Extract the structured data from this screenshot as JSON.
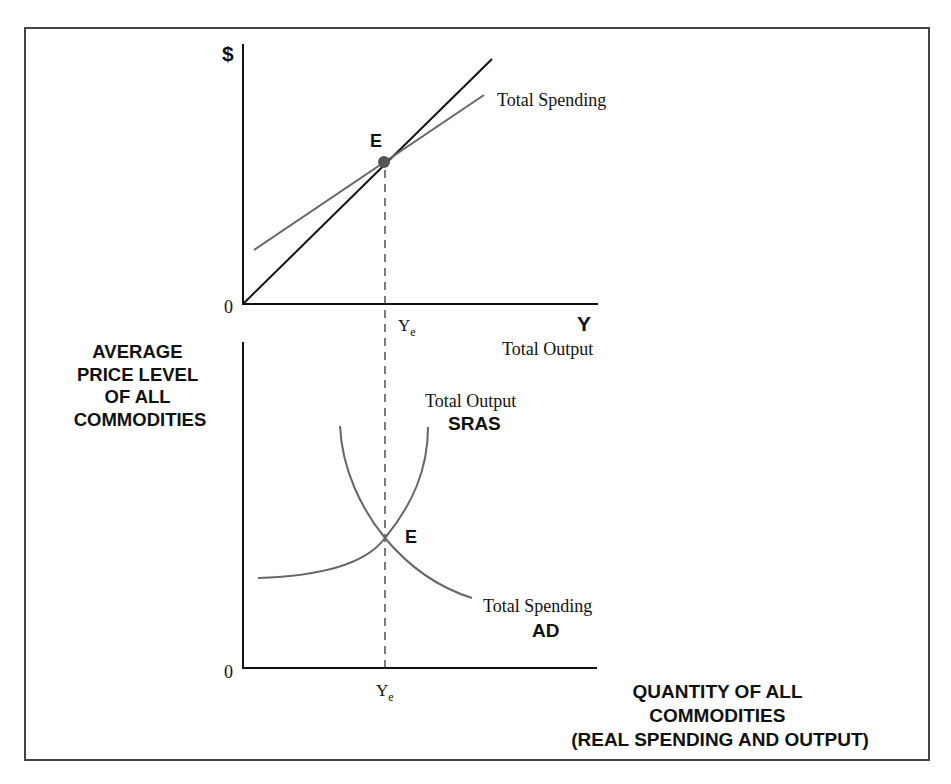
{
  "top_panel": {
    "y_axis_label": "$",
    "origin_label": "0",
    "x_axis_letter": "Y",
    "x_axis_caption": "Total Output",
    "equilibrium_label": "E",
    "equilibrium_tick_label": "Y",
    "equilibrium_tick_sub": "e",
    "spending_line_label": "Total Spending"
  },
  "bottom_panel": {
    "y_axis_label_lines": [
      "AVERAGE",
      "PRICE LEVEL",
      "OF ALL",
      "COMMODITIES"
    ],
    "origin_label": "0",
    "x_axis_label_lines": [
      "QUANTITY OF ALL",
      "COMMODITIES",
      "(REAL SPENDING AND OUTPUT)"
    ],
    "equilibrium_label": "E",
    "equilibrium_tick_label": "Y",
    "equilibrium_tick_sub": "e",
    "supply_curve_caption": "Total Output",
    "supply_curve_name": "SRAS",
    "demand_curve_caption": "Total Spending",
    "demand_curve_name": "AD"
  },
  "colors": {
    "frame": "#444444",
    "axis": "#111111",
    "output_line": "#111111",
    "curve": "#666666",
    "dot": "#555555"
  }
}
